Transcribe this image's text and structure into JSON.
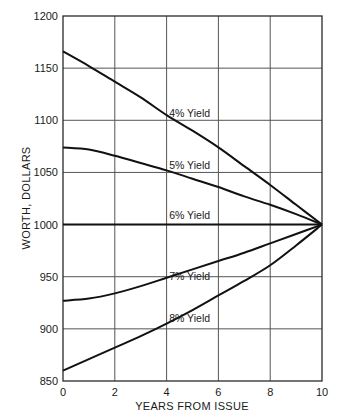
{
  "chart_data": {
    "type": "line",
    "title": "",
    "xlabel": "YEARS FROM ISSUE",
    "ylabel": "WORTH, DOLLARS",
    "xlim": [
      0,
      10
    ],
    "ylim": [
      850,
      1200
    ],
    "x_ticks": [
      0,
      2,
      4,
      6,
      8,
      10
    ],
    "y_ticks": [
      850,
      900,
      950,
      1000,
      1050,
      1100,
      1150,
      1200
    ],
    "grid": true,
    "legend": "inline labels",
    "x": [
      0,
      1,
      2,
      3,
      4,
      5,
      6,
      7,
      8,
      9,
      10
    ],
    "series": [
      {
        "name": "4% Yield",
        "values": [
          1166,
          1152,
          1137,
          1122,
          1105,
          1090,
          1074,
          1056,
          1038,
          1019,
          1000
        ]
      },
      {
        "name": "5% Yield",
        "values": [
          1074,
          1072,
          1066,
          1059,
          1052,
          1044,
          1036,
          1027,
          1019,
          1010,
          1000
        ]
      },
      {
        "name": "6% Yield",
        "values": [
          1000,
          1000,
          1000,
          1000,
          1000,
          1000,
          1000,
          1000,
          1000,
          1000,
          1000
        ]
      },
      {
        "name": "7% Yield",
        "values": [
          927,
          929,
          934,
          941,
          949,
          957,
          965,
          973,
          982,
          991,
          1000
        ]
      },
      {
        "name": "8% Yield",
        "values": [
          860,
          871,
          882,
          893,
          905,
          918,
          932,
          946,
          961,
          980,
          1000
        ]
      }
    ],
    "annotations": [
      {
        "text": "4% Yield",
        "x": 4.1,
        "y": 1103
      },
      {
        "text": "5% Yield",
        "x": 4.1,
        "y": 1053
      },
      {
        "text": "6% Yield",
        "x": 4.1,
        "y": 1005
      },
      {
        "text": "7% Yield",
        "x": 4.1,
        "y": 947
      },
      {
        "text": "8% Yield",
        "x": 4.1,
        "y": 907
      }
    ]
  },
  "axes": {
    "xlabel": "YEARS FROM ISSUE",
    "ylabel": "WORTH, DOLLARS",
    "x_tick_labels": [
      "0",
      "2",
      "4",
      "6",
      "8",
      "10"
    ],
    "y_tick_labels": [
      "850",
      "900",
      "950",
      "1000",
      "1050",
      "1100",
      "1150",
      "1200"
    ]
  }
}
